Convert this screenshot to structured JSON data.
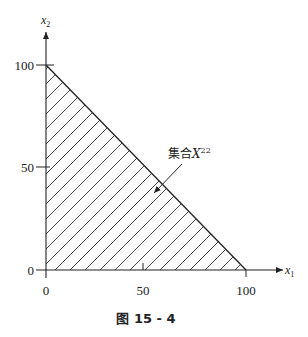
{
  "axes": {
    "x_label": "x",
    "x_label_sub": "1",
    "y_label": "x",
    "y_label_sub": "2",
    "x_ticks": [
      "0",
      "50",
      "100"
    ],
    "y_ticks": [
      "0",
      "50",
      "100"
    ]
  },
  "region": {
    "label_prefix": "集合",
    "label_var": "X",
    "label_sup": "22",
    "vertices": [
      [
        0,
        0
      ],
      [
        100,
        0
      ],
      [
        0,
        100
      ]
    ],
    "fill": "hatched"
  },
  "caption": "图 15 - 4"
}
